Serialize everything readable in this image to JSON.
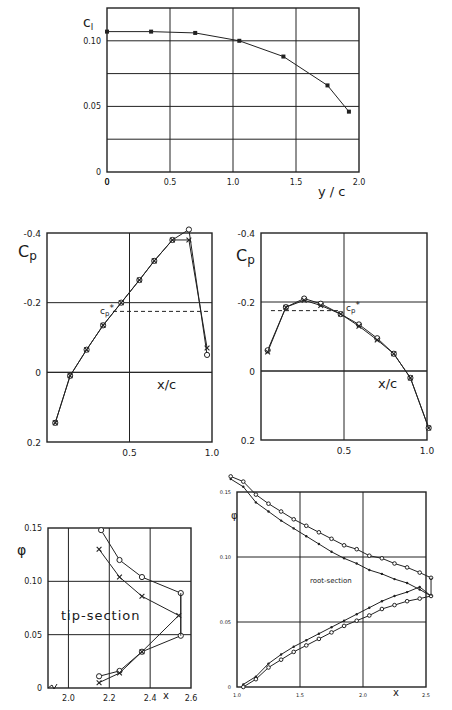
{
  "chart_data": [
    {
      "id": "cl-span",
      "type": "line",
      "title": "",
      "xlabel": "y / c",
      "ylabel": "c_l",
      "xlim": [
        0,
        2.0
      ],
      "ylim": [
        0,
        0.125
      ],
      "grid": true,
      "x_ticks": [
        0,
        0.5,
        1.0,
        1.5,
        2.0
      ],
      "x_tick_labels": [
        "0",
        "0.5",
        "1.0",
        "1.5",
        "2.0"
      ],
      "y_gridlines": [
        0.025,
        0.05,
        0.075,
        0.1
      ],
      "y_tick_labels": [
        {
          "v": 0,
          "t": "0"
        },
        {
          "v": 0.05,
          "t": "0.05"
        },
        {
          "v": 0.1,
          "t": "0.10"
        }
      ],
      "box": {
        "x0": 107,
        "x1": 359,
        "y0": 172,
        "y1": 8
      },
      "series": [
        {
          "name": "c_l",
          "marker": "square",
          "x": [
            0,
            0.35,
            0.7,
            1.05,
            1.4,
            1.75,
            1.92
          ],
          "y": [
            0.107,
            0.107,
            0.106,
            0.1,
            0.088,
            0.066,
            0.046
          ]
        }
      ]
    },
    {
      "id": "cp-left",
      "type": "line",
      "xlabel": "x/c",
      "ylabel": "Cp",
      "xlim": [
        0,
        1.0
      ],
      "ylim": [
        0.2,
        -0.4
      ],
      "grid": true,
      "x_ticks": [
        0.5,
        1.0
      ],
      "x_tick_labels": [
        "0.5",
        "1.0"
      ],
      "y_tick_labels": [
        {
          "v": -0.4,
          "t": "-0.4"
        },
        {
          "v": -0.2,
          "t": "-0.2"
        },
        {
          "v": 0,
          "t": "0"
        },
        {
          "v": 0.2,
          "t": "0.2"
        }
      ],
      "box": {
        "x0": 47,
        "x1": 212,
        "y0": 442,
        "y1": 233
      },
      "annotation": {
        "label": "cp*",
        "value": -0.175,
        "x_start": 0.4,
        "x_end": 0.98
      },
      "series": [
        {
          "name": "circles",
          "marker": "circle",
          "x": [
            0.05,
            0.14,
            0.24,
            0.34,
            0.45,
            0.56,
            0.65,
            0.76,
            0.86,
            0.97
          ],
          "y": [
            0.145,
            0.01,
            -0.065,
            -0.135,
            -0.2,
            -0.265,
            -0.32,
            -0.38,
            -0.41,
            -0.05
          ]
        },
        {
          "name": "crosses",
          "marker": "cross",
          "x": [
            0.05,
            0.14,
            0.24,
            0.34,
            0.45,
            0.56,
            0.65,
            0.76,
            0.86,
            0.97
          ],
          "y": [
            0.145,
            0.01,
            -0.065,
            -0.135,
            -0.2,
            -0.265,
            -0.32,
            -0.38,
            -0.38,
            -0.07
          ]
        }
      ]
    },
    {
      "id": "cp-right",
      "type": "line",
      "xlabel": "x/c",
      "ylabel": "Cp",
      "xlim": [
        0,
        1.0
      ],
      "ylim": [
        0.2,
        -0.4
      ],
      "grid": true,
      "x_ticks": [
        0.5,
        1.0
      ],
      "x_tick_labels": [
        "0.5",
        "1.0"
      ],
      "y_tick_labels": [
        {
          "v": -0.4,
          "t": "-0.4"
        },
        {
          "v": -0.2,
          "t": "-0.2"
        },
        {
          "v": 0,
          "t": "0"
        },
        {
          "v": 0.2,
          "t": "0.2"
        }
      ],
      "box": {
        "x0": 261,
        "x1": 427,
        "y0": 440,
        "y1": 233
      },
      "annotation": {
        "label": "cp*",
        "value": -0.175,
        "x_start": 0.06,
        "x_end": 0.48
      },
      "series": [
        {
          "name": "circles",
          "marker": "circle",
          "x": [
            0.04,
            0.15,
            0.26,
            0.36,
            0.48,
            0.59,
            0.7,
            0.8,
            0.9,
            1.01
          ],
          "y": [
            -0.06,
            -0.185,
            -0.21,
            -0.195,
            -0.165,
            -0.135,
            -0.095,
            -0.05,
            0.02,
            0.165
          ]
        },
        {
          "name": "crosses",
          "marker": "cross",
          "x": [
            0.04,
            0.15,
            0.26,
            0.36,
            0.48,
            0.59,
            0.7,
            0.8,
            0.9,
            1.01
          ],
          "y": [
            -0.055,
            -0.185,
            -0.205,
            -0.19,
            -0.165,
            -0.13,
            -0.09,
            -0.05,
            0.02,
            0.165
          ]
        }
      ]
    },
    {
      "id": "phi-tip",
      "type": "line",
      "title": "tip-section",
      "xlabel": "x",
      "ylabel": "φ",
      "xlim": [
        1.9,
        2.6
      ],
      "ylim": [
        0,
        0.15
      ],
      "grid": true,
      "x_ticks": [
        2.0,
        2.2,
        2.4,
        2.6
      ],
      "x_tick_labels": [
        "2.0",
        "2.2",
        "2.4",
        "2.6"
      ],
      "y_tick_labels": [
        {
          "v": 0,
          "t": "0"
        },
        {
          "v": 0.05,
          "t": "0.05"
        },
        {
          "v": 0.1,
          "t": "0.10"
        },
        {
          "v": 0.15,
          "t": "0.15"
        }
      ],
      "box": {
        "x0": 48,
        "x1": 191,
        "y0": 688,
        "y1": 528
      },
      "series": [
        {
          "name": "circles",
          "marker": "circle",
          "x": [
            2.16,
            2.25,
            2.36,
            2.55,
            2.55,
            2.36,
            2.25,
            2.15
          ],
          "y": [
            0.148,
            0.12,
            0.104,
            0.089,
            0.049,
            0.034,
            0.016,
            0.011
          ]
        },
        {
          "name": "crosses",
          "marker": "cross",
          "x": [
            2.15,
            2.25,
            2.36,
            2.54,
            2.36,
            2.25,
            2.15
          ],
          "y": [
            0.13,
            0.104,
            0.086,
            0.068,
            0.034,
            0.014,
            0.005
          ]
        }
      ]
    },
    {
      "id": "phi-root",
      "type": "line",
      "title": "root-section",
      "xlabel": "x",
      "ylabel": "φ",
      "xlim": [
        1.0,
        2.5
      ],
      "ylim": [
        0,
        0.15
      ],
      "grid": true,
      "x_ticks": [
        1.0,
        1.5,
        2.0,
        2.5
      ],
      "x_tick_labels": [
        "1.0",
        "1.5",
        "2.0",
        "2.5"
      ],
      "y_tick_labels": [
        {
          "v": 0,
          "t": "0"
        },
        {
          "v": 0.05,
          "t": "0.05"
        },
        {
          "v": 0.1,
          "t": "0.10"
        },
        {
          "v": 0.15,
          "t": "0.15"
        }
      ],
      "box": {
        "x0": 237,
        "x1": 426,
        "y0": 687,
        "y1": 492
      },
      "series": [
        {
          "name": "circles-upper",
          "marker": "circle",
          "x": [
            0.95,
            1.05,
            1.15,
            1.25,
            1.35,
            1.45,
            1.55,
            1.65,
            1.75,
            1.85,
            1.95,
            2.05,
            2.15,
            2.25,
            2.35,
            2.45,
            2.54
          ],
          "y": [
            0.162,
            0.158,
            0.148,
            0.141,
            0.135,
            0.129,
            0.124,
            0.119,
            0.114,
            0.109,
            0.106,
            0.101,
            0.099,
            0.095,
            0.092,
            0.088,
            0.084
          ]
        },
        {
          "name": "crosses-upper",
          "marker": "dot",
          "x": [
            0.95,
            1.05,
            1.15,
            1.25,
            1.35,
            1.45,
            1.55,
            1.65,
            1.75,
            1.85,
            1.95,
            2.05,
            2.15,
            2.25,
            2.35,
            2.45,
            2.54
          ],
          "y": [
            0.16,
            0.154,
            0.142,
            0.135,
            0.128,
            0.122,
            0.116,
            0.11,
            0.104,
            0.099,
            0.095,
            0.09,
            0.087,
            0.083,
            0.08,
            0.075,
            0.07
          ]
        },
        {
          "name": "crosses-lower",
          "marker": "dot",
          "x": [
            1.05,
            1.15,
            1.25,
            1.35,
            1.45,
            1.55,
            1.65,
            1.75,
            1.85,
            1.95,
            2.05,
            2.15,
            2.25,
            2.35,
            2.45,
            2.54
          ],
          "y": [
            0.002,
            0.008,
            0.018,
            0.025,
            0.031,
            0.036,
            0.041,
            0.046,
            0.051,
            0.056,
            0.061,
            0.066,
            0.07,
            0.073,
            0.077,
            0.07
          ]
        },
        {
          "name": "circles-lower",
          "marker": "circle",
          "x": [
            1.05,
            1.15,
            1.25,
            1.35,
            1.45,
            1.55,
            1.65,
            1.75,
            1.85,
            1.95,
            2.05,
            2.15,
            2.25,
            2.35,
            2.45,
            2.54
          ],
          "y": [
            0.0,
            0.006,
            0.015,
            0.021,
            0.027,
            0.032,
            0.037,
            0.042,
            0.047,
            0.051,
            0.055,
            0.06,
            0.063,
            0.066,
            0.068,
            0.07
          ]
        }
      ]
    }
  ],
  "labels": {
    "cl_axis": "c",
    "cl_axis_sub": "l",
    "cp_axis": "C",
    "cp_axis_sub": "p",
    "cp_star": "c",
    "cp_star_sub": "p",
    "cp_star_sup": "*",
    "y_over_c": "y / c",
    "x_over_c": "x/c",
    "phi": "φ",
    "x": "x",
    "tip_section": "tip-section",
    "root_section": "root-section"
  }
}
